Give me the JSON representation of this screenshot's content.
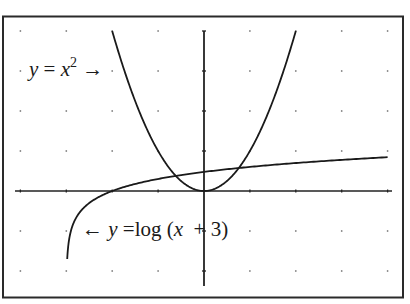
{
  "chart_data": {
    "type": "line",
    "title": "",
    "xlabel": "",
    "ylabel": "",
    "xlim": [
      -4,
      4
    ],
    "ylim": [
      -2,
      4
    ],
    "x_ticks": [
      -4,
      -3,
      -2,
      -1,
      0,
      1,
      2,
      3,
      4
    ],
    "y_ticks": [
      -2,
      -1,
      0,
      1,
      2,
      3,
      4
    ],
    "grid": "dots",
    "legend": "none",
    "series": [
      {
        "name": "y = x^2",
        "function": "x^2",
        "domain": [
          -2,
          2
        ],
        "x": [
          -2,
          -1.5,
          -1,
          -0.5,
          0,
          0.5,
          1,
          1.5,
          2
        ],
        "values": [
          4,
          2.25,
          1,
          0.25,
          0,
          0.25,
          1,
          2.25,
          4
        ],
        "color": "#1a1a1a"
      },
      {
        "name": "y = log(x + 3)",
        "function": "log10(x+3)",
        "domain": [
          -2.98,
          4
        ],
        "x": [
          -2.98,
          -2.9,
          -2.5,
          -2,
          -1,
          0,
          1,
          2,
          3,
          4
        ],
        "values": [
          -1.7,
          -1.0,
          -0.3,
          0,
          0.301,
          0.477,
          0.602,
          0.699,
          0.778,
          0.845
        ],
        "color": "#1a1a1a"
      }
    ],
    "annotations": [
      {
        "text": "y = x² →",
        "points_to": "parabola",
        "position": "upper-left"
      },
      {
        "text": "← y = log (x + 3)",
        "points_to": "log curve",
        "position": "lower-left"
      }
    ]
  },
  "labels": {
    "parabola": {
      "y": "y",
      "eq": " = ",
      "x": "x",
      "exp": "2",
      "arrow": " →"
    },
    "log": {
      "arrow": "← ",
      "y": "y",
      "eq": " =log (",
      "x": "x",
      "rest": "  + 3)"
    }
  }
}
